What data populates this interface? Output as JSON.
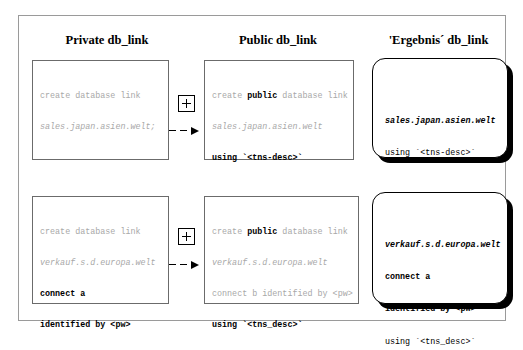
{
  "top_partial_text": "·   ·   ·   ·",
  "diagram": {
    "columns": [
      {
        "id": "private",
        "heading": "Private db_link"
      },
      {
        "id": "public",
        "heading": "Public db_link"
      },
      {
        "id": "result",
        "heading": "'Ergebnis´ db_link"
      }
    ],
    "connector": {
      "plus_symbol": "+",
      "arrow_symbol": "→"
    },
    "rows": [
      {
        "id": "row-1",
        "private": {
          "lines": [
            {
              "text": "create database link",
              "style": "gray"
            },
            {
              "text": "sales.japan.asien.welt;",
              "style": "grayi"
            }
          ]
        },
        "public": {
          "lines": [
            {
              "text": "create public database link",
              "style": "gray",
              "keyword": "public"
            },
            {
              "text": "sales.japan.asien.welt",
              "style": "grayi"
            },
            {
              "text": "using `<tns-desc>`",
              "style": "bold"
            }
          ]
        },
        "result": {
          "lines": [
            {
              "text": "sales.japan.asien.welt",
              "style": "boldi"
            },
            {
              "text": "using `<tns-desc>`",
              "style": "plain"
            }
          ]
        }
      },
      {
        "id": "row-2",
        "private": {
          "lines": [
            {
              "text": "create database link",
              "style": "gray"
            },
            {
              "text": "verkauf.s.d.europa.welt",
              "style": "grayi"
            },
            {
              "text": "connect a",
              "style": "bold"
            },
            {
              "text": "identified by <pw>",
              "style": "bold"
            }
          ]
        },
        "public": {
          "lines": [
            {
              "text": "create public database link",
              "style": "gray",
              "keyword": "public"
            },
            {
              "text": "verkauf.s.d.europa.welt",
              "style": "grayi"
            },
            {
              "text": "connect b identified by <pw>",
              "style": "gray"
            },
            {
              "text": "using `<tns_desc>`",
              "style": "bold"
            }
          ]
        },
        "result": {
          "lines": [
            {
              "text": "verkauf.s.d.europa.welt",
              "style": "boldi"
            },
            {
              "text": "connect a",
              "style": "bold"
            },
            {
              "text": "identified by <pw>",
              "style": "bold"
            },
            {
              "text": "using `<tns_desc>`",
              "style": "plain"
            }
          ]
        }
      }
    ]
  },
  "colors": {
    "gray_text": "#a8a8a8",
    "black_text": "#000000",
    "box_border": "#6b6b6b",
    "frame_border": "#9a9a9a",
    "result_border": "#000000",
    "background": "#ffffff"
  }
}
